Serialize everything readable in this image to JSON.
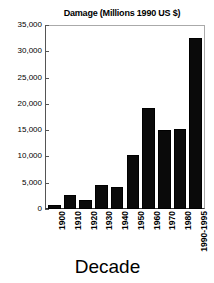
{
  "chart_data": {
    "type": "bar",
    "title": "Damage (Millions 1990 US $)",
    "xlabel": "Decade",
    "ylabel": "",
    "categories": [
      "1900",
      "1910",
      "1920",
      "1930",
      "1940",
      "1950",
      "1960",
      "1970",
      "1980",
      "1990-1995"
    ],
    "values": [
      800,
      2600,
      1700,
      4600,
      4200,
      10300,
      19200,
      15100,
      15300,
      32500
    ],
    "ylim": [
      0,
      35000
    ],
    "yticks": [
      0,
      5000,
      10000,
      15000,
      20000,
      25000,
      30000,
      35000
    ],
    "ytick_labels": [
      "0",
      "5,000",
      "10,000",
      "15,000",
      "20,000",
      "25,000",
      "30,000",
      "35,000"
    ],
    "grid": false,
    "legend": false,
    "bar_color": "#0a0a0a",
    "background_color": "#ffffff"
  }
}
